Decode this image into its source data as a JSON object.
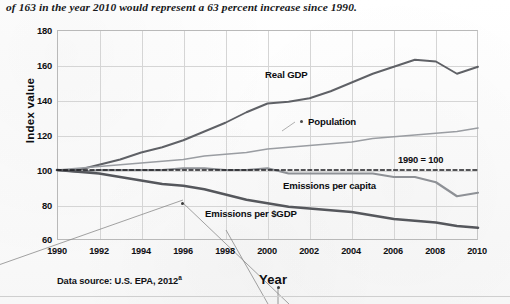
{
  "caption": "of 163 in the year 2010 would represent a 63 percent increase since 1990.",
  "axis": {
    "ylabel": "Index value",
    "xlabel": "Year",
    "yticks": [
      "180",
      "160",
      "140",
      "120",
      "100",
      "80",
      "60"
    ],
    "xticks": [
      "1990",
      "1992",
      "1994",
      "1996",
      "1998",
      "2000",
      "2002",
      "2004",
      "2006",
      "2008",
      "2010"
    ]
  },
  "annotations": {
    "real_gdp": "Real GDP",
    "population": "Population",
    "baseline": "1990 = 100",
    "emissions_per_capita": "Emissions per capita",
    "emissions_per_gdp": "Emissions per $GDP"
  },
  "source": "Data source: U.S. EPA, 2012",
  "source_superscript": "a",
  "colors": {
    "real_gdp": "#5f6166",
    "population": "#9a9da2",
    "emissions_per_capita": "#8e9196",
    "emissions_per_gdp": "#55575c",
    "baseline": "#1c1d20",
    "grid": "#d5d5d5",
    "frame": "#b9b9b9",
    "text": "#0d0e11"
  },
  "chart_data": {
    "type": "line",
    "title": "",
    "xlabel": "Year",
    "ylabel": "Index value",
    "xlim": [
      1990,
      2010
    ],
    "ylim": [
      60,
      180
    ],
    "grid": true,
    "legend": "inline-annotations",
    "note": "1990 = 100 baseline (dashed reference line)",
    "x": [
      1990,
      1991,
      1992,
      1993,
      1994,
      1995,
      1996,
      1997,
      1998,
      1999,
      2000,
      2001,
      2002,
      2003,
      2004,
      2005,
      2006,
      2007,
      2008,
      2009,
      2010
    ],
    "series": [
      {
        "name": "Real GDP",
        "values": [
          100,
          100,
          103,
          106,
          110,
          113,
          117,
          122,
          127,
          133,
          138,
          139,
          141,
          145,
          150,
          155,
          159,
          163,
          162,
          155,
          159
        ]
      },
      {
        "name": "Population",
        "values": [
          100,
          101,
          102,
          103,
          104,
          105,
          106,
          108,
          109,
          110,
          112,
          113,
          114,
          115,
          116,
          118,
          119,
          120,
          121,
          122,
          124
        ]
      },
      {
        "name": "Emissions per capita",
        "values": [
          100,
          99,
          100,
          100,
          100,
          100,
          101,
          101,
          100,
          100,
          101,
          98,
          98,
          98,
          98,
          98,
          96,
          96,
          93,
          85,
          87
        ]
      },
      {
        "name": "Emissions per $GDP",
        "values": [
          100,
          99,
          98,
          96,
          94,
          92,
          91,
          89,
          86,
          83,
          81,
          79,
          78,
          77,
          76,
          74,
          72,
          71,
          70,
          68,
          67
        ]
      },
      {
        "name": "1990 = 100",
        "values": [
          100,
          100,
          100,
          100,
          100,
          100,
          100,
          100,
          100,
          100,
          100,
          100,
          100,
          100,
          100,
          100,
          100,
          100,
          100,
          100,
          100
        ],
        "style": "dashed-reference"
      }
    ]
  }
}
